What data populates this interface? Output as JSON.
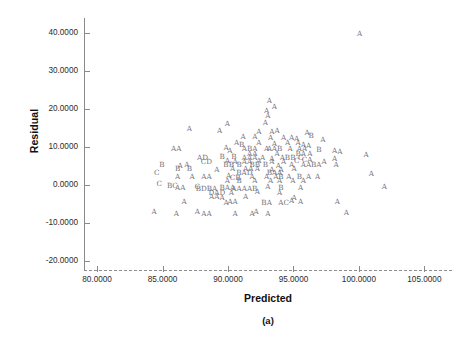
{
  "chart_data": {
    "type": "scatter",
    "title": "",
    "subtitle": "",
    "caption": "(a)",
    "xlabel": "Predicted",
    "ylabel": "Residual",
    "grid": false,
    "legend": null,
    "xlim": [
      79.0,
      106.5
    ],
    "ylim": [
      -22.5,
      44.0
    ],
    "xticks": [
      80.0,
      85.0,
      90.0,
      95.0,
      100.0,
      105.0
    ],
    "xticklabels": [
      "80.0000",
      "85.0000",
      "90.0000",
      "95.0000",
      "100.0000",
      "105.0000"
    ],
    "yticks": [
      40.0,
      30.0,
      20.0,
      10.0,
      0.0,
      -10.0,
      -20.0
    ],
    "yticklabels": [
      "40.0000",
      "30.0000",
      "20.0000",
      "10.0000",
      "0.0000",
      "-10.0000",
      "-20.0000"
    ],
    "marker_style": "letter-density-code",
    "marker_note": "Letters A, B, C, D encode the number of coincident observations at a plotted location (A=1, B=2, C=3, D=4).",
    "marker_color": "#70707a",
    "axis_color": "#8a8a8a",
    "label_color": "#111111",
    "background_color": "#ffffff",
    "points": [
      {
        "x": 100.05,
        "y": 39.8,
        "label": "A"
      },
      {
        "x": 93.15,
        "y": 22.1,
        "label": "A"
      },
      {
        "x": 93.55,
        "y": 20.6,
        "label": "A"
      },
      {
        "x": 92.95,
        "y": 19.4,
        "label": "A"
      },
      {
        "x": 93.05,
        "y": 18.2,
        "label": "A"
      },
      {
        "x": 89.95,
        "y": 16.1,
        "label": "A"
      },
      {
        "x": 92.85,
        "y": 16.3,
        "label": "A"
      },
      {
        "x": 87.05,
        "y": 14.6,
        "label": "A"
      },
      {
        "x": 89.35,
        "y": 14.2,
        "label": "A"
      },
      {
        "x": 92.35,
        "y": 14.0,
        "label": "A"
      },
      {
        "x": 93.35,
        "y": 13.9,
        "label": "A"
      },
      {
        "x": 93.75,
        "y": 14.2,
        "label": "A"
      },
      {
        "x": 96.05,
        "y": 13.6,
        "label": "A"
      },
      {
        "x": 96.35,
        "y": 12.9,
        "label": "B"
      },
      {
        "x": 91.15,
        "y": 12.5,
        "label": "A"
      },
      {
        "x": 92.05,
        "y": 12.6,
        "label": "A"
      },
      {
        "x": 93.25,
        "y": 12.4,
        "label": "A"
      },
      {
        "x": 94.25,
        "y": 12.3,
        "label": "A"
      },
      {
        "x": 94.85,
        "y": 12.4,
        "label": "A"
      },
      {
        "x": 95.25,
        "y": 12.1,
        "label": "A"
      },
      {
        "x": 97.25,
        "y": 11.8,
        "label": "A"
      },
      {
        "x": 90.65,
        "y": 11.1,
        "label": "A"
      },
      {
        "x": 91.05,
        "y": 10.5,
        "label": "B"
      },
      {
        "x": 92.35,
        "y": 10.9,
        "label": "A"
      },
      {
        "x": 93.55,
        "y": 10.7,
        "label": "A"
      },
      {
        "x": 94.55,
        "y": 10.9,
        "label": "A"
      },
      {
        "x": 95.35,
        "y": 11.0,
        "label": "A"
      },
      {
        "x": 95.75,
        "y": 10.6,
        "label": "A"
      },
      {
        "x": 96.15,
        "y": 10.3,
        "label": "A"
      },
      {
        "x": 86.05,
        "y": 9.4,
        "label": "AA"
      },
      {
        "x": 89.85,
        "y": 9.6,
        "label": "A"
      },
      {
        "x": 90.15,
        "y": 9.0,
        "label": "A"
      },
      {
        "x": 91.25,
        "y": 9.4,
        "label": "A"
      },
      {
        "x": 91.65,
        "y": 9.3,
        "label": "B"
      },
      {
        "x": 92.05,
        "y": 9.4,
        "label": "A"
      },
      {
        "x": 92.95,
        "y": 9.3,
        "label": "A"
      },
      {
        "x": 93.55,
        "y": 9.5,
        "label": "AAB"
      },
      {
        "x": 94.75,
        "y": 9.4,
        "label": "A"
      },
      {
        "x": 95.65,
        "y": 9.3,
        "label": "AA"
      },
      {
        "x": 96.95,
        "y": 9.1,
        "label": "B"
      },
      {
        "x": 98.15,
        "y": 9.0,
        "label": "A"
      },
      {
        "x": 98.55,
        "y": 8.6,
        "label": "A"
      },
      {
        "x": 91.85,
        "y": 8.1,
        "label": "AA"
      },
      {
        "x": 93.75,
        "y": 8.1,
        "label": "A"
      },
      {
        "x": 95.55,
        "y": 8.0,
        "label": "BA"
      },
      {
        "x": 96.25,
        "y": 8.2,
        "label": "A"
      },
      {
        "x": 100.55,
        "y": 7.9,
        "label": "A"
      },
      {
        "x": 88.05,
        "y": 7.1,
        "label": "AD"
      },
      {
        "x": 89.55,
        "y": 7.2,
        "label": "B"
      },
      {
        "x": 90.45,
        "y": 7.2,
        "label": "B"
      },
      {
        "x": 91.65,
        "y": 7.0,
        "label": "AAA"
      },
      {
        "x": 92.65,
        "y": 7.1,
        "label": "A"
      },
      {
        "x": 93.35,
        "y": 6.9,
        "label": "A"
      },
      {
        "x": 94.55,
        "y": 7.1,
        "label": "ABB"
      },
      {
        "x": 95.55,
        "y": 7.0,
        "label": "C"
      },
      {
        "x": 96.05,
        "y": 6.5,
        "label": "CA"
      },
      {
        "x": 98.15,
        "y": 6.8,
        "label": "A"
      },
      {
        "x": 88.35,
        "y": 6.1,
        "label": "CD"
      },
      {
        "x": 89.95,
        "y": 6.2,
        "label": "A"
      },
      {
        "x": 90.55,
        "y": 6.1,
        "label": "A"
      },
      {
        "x": 91.45,
        "y": 6.0,
        "label": "AA"
      },
      {
        "x": 92.35,
        "y": 6.3,
        "label": "A"
      },
      {
        "x": 93.35,
        "y": 6.1,
        "label": "A"
      },
      {
        "x": 94.25,
        "y": 6.0,
        "label": "A"
      },
      {
        "x": 95.25,
        "y": 6.2,
        "label": "C"
      },
      {
        "x": 97.35,
        "y": 6.0,
        "label": "A"
      },
      {
        "x": 84.95,
        "y": 5.1,
        "label": "B"
      },
      {
        "x": 86.35,
        "y": 5.0,
        "label": "A"
      },
      {
        "x": 86.85,
        "y": 5.3,
        "label": "A"
      },
      {
        "x": 90.05,
        "y": 5.1,
        "label": "BB"
      },
      {
        "x": 90.85,
        "y": 5.2,
        "label": "B"
      },
      {
        "x": 92.05,
        "y": 5.1,
        "label": "BB"
      },
      {
        "x": 92.85,
        "y": 5.2,
        "label": "B"
      },
      {
        "x": 93.85,
        "y": 5.0,
        "label": "A"
      },
      {
        "x": 94.85,
        "y": 5.1,
        "label": "A"
      },
      {
        "x": 96.35,
        "y": 5.1,
        "label": "AABA"
      },
      {
        "x": 98.25,
        "y": 5.1,
        "label": "A"
      },
      {
        "x": 86.15,
        "y": 4.2,
        "label": "B"
      },
      {
        "x": 87.05,
        "y": 4.1,
        "label": "B"
      },
      {
        "x": 89.15,
        "y": 4.0,
        "label": "A"
      },
      {
        "x": 90.35,
        "y": 4.2,
        "label": "A"
      },
      {
        "x": 91.55,
        "y": 4.1,
        "label": "AA"
      },
      {
        "x": 92.25,
        "y": 4.1,
        "label": "A"
      },
      {
        "x": 93.35,
        "y": 3.9,
        "label": "A"
      },
      {
        "x": 94.05,
        "y": 4.0,
        "label": "A"
      },
      {
        "x": 95.05,
        "y": 4.1,
        "label": "A"
      },
      {
        "x": 84.55,
        "y": 3.1,
        "label": "C"
      },
      {
        "x": 91.25,
        "y": 3.0,
        "label": "BAD"
      },
      {
        "x": 93.55,
        "y": 3.1,
        "label": "BAA"
      },
      {
        "x": 100.95,
        "y": 2.9,
        "label": "A"
      },
      {
        "x": 86.15,
        "y": 2.0,
        "label": "A"
      },
      {
        "x": 87.25,
        "y": 2.1,
        "label": "A"
      },
      {
        "x": 88.35,
        "y": 2.1,
        "label": "AA"
      },
      {
        "x": 90.05,
        "y": 2.2,
        "label": "A"
      },
      {
        "x": 90.55,
        "y": 1.9,
        "label": "CB"
      },
      {
        "x": 91.85,
        "y": 2.1,
        "label": "A"
      },
      {
        "x": 92.95,
        "y": 2.0,
        "label": "A"
      },
      {
        "x": 93.85,
        "y": 2.1,
        "label": "AB"
      },
      {
        "x": 94.65,
        "y": 2.0,
        "label": "A"
      },
      {
        "x": 95.45,
        "y": 2.1,
        "label": "B"
      },
      {
        "x": 96.15,
        "y": 2.0,
        "label": "A"
      },
      {
        "x": 96.85,
        "y": 2.0,
        "label": "A"
      },
      {
        "x": 89.95,
        "y": 1.0,
        "label": "A"
      },
      {
        "x": 90.85,
        "y": 1.1,
        "label": "B"
      },
      {
        "x": 92.05,
        "y": 1.0,
        "label": "A"
      },
      {
        "x": 93.25,
        "y": 1.1,
        "label": "A"
      },
      {
        "x": 93.95,
        "y": 0.9,
        "label": "A"
      },
      {
        "x": 94.95,
        "y": 1.0,
        "label": "A"
      },
      {
        "x": 95.75,
        "y": 1.1,
        "label": "A"
      },
      {
        "x": 84.75,
        "y": 0.1,
        "label": "C"
      },
      {
        "x": 85.75,
        "y": -0.3,
        "label": "BC"
      },
      {
        "x": 86.35,
        "y": -0.8,
        "label": "AA"
      },
      {
        "x": 87.65,
        "y": -0.6,
        "label": "C"
      },
      {
        "x": 88.35,
        "y": -1.1,
        "label": "BDBA"
      },
      {
        "x": 89.95,
        "y": -0.8,
        "label": "BAA"
      },
      {
        "x": 91.25,
        "y": -1.0,
        "label": "AAAAB"
      },
      {
        "x": 93.05,
        "y": -0.7,
        "label": "A"
      },
      {
        "x": 94.05,
        "y": -0.9,
        "label": "B"
      },
      {
        "x": 95.55,
        "y": -0.8,
        "label": "A"
      },
      {
        "x": 101.95,
        "y": -0.7,
        "label": "A"
      },
      {
        "x": 89.15,
        "y": -2.1,
        "label": "DAD"
      },
      {
        "x": 90.25,
        "y": -2.3,
        "label": "A"
      },
      {
        "x": 92.25,
        "y": -2.0,
        "label": "A"
      },
      {
        "x": 93.95,
        "y": -2.2,
        "label": "A"
      },
      {
        "x": 88.95,
        "y": -3.2,
        "label": "AA"
      },
      {
        "x": 89.55,
        "y": -3.6,
        "label": "A"
      },
      {
        "x": 91.35,
        "y": -3.3,
        "label": "A"
      },
      {
        "x": 95.05,
        "y": -3.4,
        "label": "A"
      },
      {
        "x": 86.65,
        "y": -4.6,
        "label": "A"
      },
      {
        "x": 89.85,
        "y": -4.7,
        "label": "A"
      },
      {
        "x": 90.35,
        "y": -4.6,
        "label": "AA"
      },
      {
        "x": 92.95,
        "y": -4.8,
        "label": "BA"
      },
      {
        "x": 94.25,
        "y": -4.7,
        "label": "AC"
      },
      {
        "x": 94.85,
        "y": -4.3,
        "label": "A"
      },
      {
        "x": 95.55,
        "y": -4.6,
        "label": "A"
      },
      {
        "x": 98.35,
        "y": -4.6,
        "label": "A"
      },
      {
        "x": 84.35,
        "y": -7.2,
        "label": "A"
      },
      {
        "x": 86.05,
        "y": -7.6,
        "label": "A"
      },
      {
        "x": 87.65,
        "y": -7.3,
        "label": "A"
      },
      {
        "x": 88.35,
        "y": -7.8,
        "label": "AA"
      },
      {
        "x": 90.55,
        "y": -7.6,
        "label": "A"
      },
      {
        "x": 91.85,
        "y": -7.7,
        "label": "A"
      },
      {
        "x": 92.15,
        "y": -7.3,
        "label": "A"
      },
      {
        "x": 93.05,
        "y": -7.6,
        "label": "A"
      },
      {
        "x": 99.05,
        "y": -7.4,
        "label": "A"
      }
    ]
  }
}
